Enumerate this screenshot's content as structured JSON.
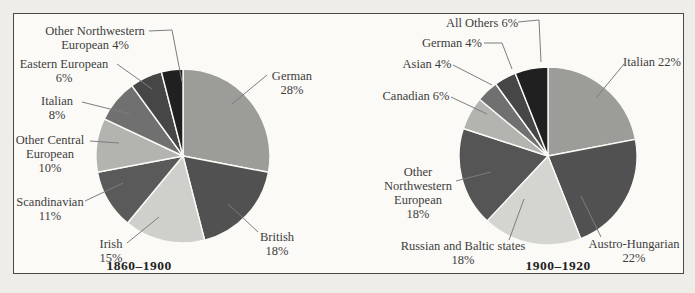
{
  "figure": {
    "background_color": "#efede8",
    "panel_color": "#fbfaf7",
    "border_color": "#4a4a4a",
    "text_color": "#3d3d3d"
  },
  "chart_data": [
    {
      "type": "pie",
      "title": "1860–1900",
      "total": 100,
      "legend_position": "callout-labels",
      "slices": [
        {
          "label": "German",
          "value": 28,
          "color": "#9c9c99",
          "display_lines": [
            "German",
            "28%"
          ]
        },
        {
          "label": "British",
          "value": 18,
          "color": "#515151",
          "display_lines": [
            "British",
            "18%"
          ]
        },
        {
          "label": "Irish",
          "value": 15,
          "color": "#cfcfcc",
          "display_lines": [
            "Irish",
            "15%"
          ]
        },
        {
          "label": "Scandinavian",
          "value": 11,
          "color": "#5a5a5a",
          "display_lines": [
            "Scandinavian",
            "11%"
          ]
        },
        {
          "label": "Other Central European",
          "value": 10,
          "color": "#b3b3b0",
          "display_lines": [
            "Other Central",
            "European",
            "10%"
          ]
        },
        {
          "label": "Italian",
          "value": 8,
          "color": "#707070",
          "display_lines": [
            "Italian",
            "8%"
          ]
        },
        {
          "label": "Eastern European",
          "value": 6,
          "color": "#464646",
          "display_lines": [
            "Eastern European",
            "6%"
          ]
        },
        {
          "label": "Other Northwestern European",
          "value": 4,
          "color": "#202020",
          "display_lines": [
            "Other Northwestern",
            "European 4%"
          ]
        }
      ]
    },
    {
      "type": "pie",
      "title": "1900–1920",
      "total": 100,
      "legend_position": "callout-labels",
      "slices": [
        {
          "label": "Italian",
          "value": 22,
          "color": "#9c9c99",
          "display_lines": [
            "Italian 22%"
          ]
        },
        {
          "label": "Austro-Hungarian",
          "value": 22,
          "color": "#515151",
          "display_lines": [
            "Austro-Hungarian",
            "22%"
          ]
        },
        {
          "label": "Russian and Baltic states",
          "value": 18,
          "color": "#d4d4d1",
          "display_lines": [
            "Russian and Baltic states",
            "18%"
          ]
        },
        {
          "label": "Other Northwestern European",
          "value": 18,
          "color": "#555555",
          "display_lines": [
            "Other",
            "Northwestern",
            "European",
            "18%"
          ]
        },
        {
          "label": "Canadian",
          "value": 6,
          "color": "#b3b3b0",
          "display_lines": [
            "Canadian 6%"
          ]
        },
        {
          "label": "Asian",
          "value": 4,
          "color": "#707070",
          "display_lines": [
            "Asian 4%"
          ]
        },
        {
          "label": "German",
          "value": 4,
          "color": "#464646",
          "display_lines": [
            "German 4%"
          ]
        },
        {
          "label": "All Others",
          "value": 6,
          "color": "#202020",
          "display_lines": [
            "All Others 6%"
          ]
        }
      ]
    }
  ]
}
